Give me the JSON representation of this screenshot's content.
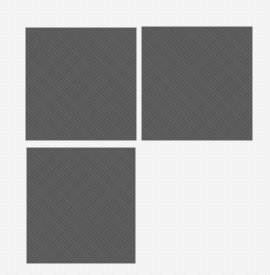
{
  "canvas": {
    "background": "#f4f4f4"
  },
  "tiles": [
    {
      "name": "tile-top-left",
      "color": "#5b5b5b",
      "x": 26,
      "y": 28,
      "w": 110,
      "h": 112
    },
    {
      "name": "tile-top-right",
      "color": "#5b5b5b",
      "x": 142,
      "y": 27,
      "w": 110,
      "h": 113
    },
    {
      "name": "tile-bottom-left",
      "color": "#5b5b5b",
      "x": 27,
      "y": 148,
      "w": 108,
      "h": 115
    }
  ]
}
